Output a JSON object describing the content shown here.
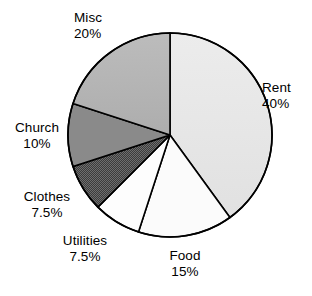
{
  "chart_data": {
    "type": "pie",
    "title": "",
    "subtitle": "",
    "xlabel": "",
    "ylabel": "",
    "legend_position": "none",
    "grid": false,
    "start_angle_deg": 0,
    "direction": "clockwise",
    "categories": [
      "Rent",
      "Food",
      "Utilities",
      "Clothes",
      "Church",
      "Misc"
    ],
    "values": [
      40,
      15,
      7.5,
      7.5,
      10,
      20
    ],
    "value_unit": "%",
    "slices": [
      {
        "name": "Rent",
        "value": 40,
        "value_label": "40%",
        "sweep_deg": 144,
        "start_deg": 0,
        "end_deg": 144,
        "fill": "#e6e6e6",
        "pattern": "solid",
        "stroke": "#000000",
        "label_name": "Rent",
        "label_value": "40%",
        "label_align": "left"
      },
      {
        "name": "Food",
        "value": 15,
        "value_label": "15%",
        "sweep_deg": 54,
        "start_deg": 144,
        "end_deg": 198,
        "fill": "#fbfbfb",
        "pattern": "solid",
        "stroke": "#000000",
        "label_name": "Food",
        "label_value": "15%",
        "label_align": "center"
      },
      {
        "name": "Utilities",
        "value": 7.5,
        "value_label": "7.5%",
        "sweep_deg": 27,
        "start_deg": 198,
        "end_deg": 225,
        "fill": "#fdfdfd",
        "pattern": "solid",
        "stroke": "#000000",
        "label_name": "Utilities",
        "label_value": "7.5%",
        "label_align": "center"
      },
      {
        "name": "Clothes",
        "value": 7.5,
        "value_label": "7.5%",
        "sweep_deg": 27,
        "start_deg": 225,
        "end_deg": 252,
        "fill": "#4a4a4a",
        "pattern": "checker-dither",
        "stroke": "#000000",
        "label_name": "Clothes",
        "label_value": "7.5%",
        "label_align": "center"
      },
      {
        "name": "Church",
        "value": 10,
        "value_label": "10%",
        "sweep_deg": 36,
        "start_deg": 252,
        "end_deg": 288,
        "fill": "#8a8a8a",
        "pattern": "solid",
        "stroke": "#000000",
        "label_name": "Church",
        "label_value": "10%",
        "label_align": "right"
      },
      {
        "name": "Misc",
        "value": 20,
        "value_label": "20%",
        "sweep_deg": 72,
        "start_deg": 288,
        "end_deg": 360,
        "fill": "#b5b5b5",
        "pattern": "solid",
        "stroke": "#000000",
        "label_name": "Misc",
        "label_value": "20%",
        "label_align": "left"
      }
    ],
    "geometry": {
      "center_x": 170,
      "center_y": 135,
      "radius": 102
    },
    "colors": {
      "background": "#ffffff",
      "outline": "#000000",
      "text": "#000000"
    }
  }
}
